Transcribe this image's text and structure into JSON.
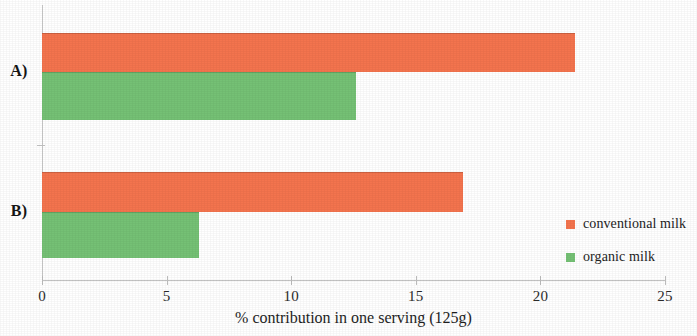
{
  "chart_data": {
    "type": "bar",
    "orientation": "horizontal",
    "title": "",
    "subtitle": "",
    "categories": [
      "A)",
      "B)"
    ],
    "series": [
      {
        "name": "conventional milk",
        "color": "#f4744e",
        "values": [
          21.4,
          16.9
        ]
      },
      {
        "name": "organic milk",
        "color": "#75c175",
        "values": [
          12.6,
          6.3
        ]
      }
    ],
    "xlabel": "% contribution in one serving (125g)",
    "ylabel": "",
    "xlim": [
      0,
      25
    ],
    "xticks": [
      0,
      5,
      10,
      15,
      20,
      25
    ],
    "xtick_labels": [
      "0",
      "5",
      "10",
      "15",
      "20",
      "25"
    ],
    "grid": false,
    "legend_position": "inside-right-lower",
    "annotations": []
  },
  "axis": {
    "x_title": "% contribution in one serving (125g)",
    "ticks": [
      {
        "value": 0,
        "label": "0"
      },
      {
        "value": 5,
        "label": "5"
      },
      {
        "value": 10,
        "label": "10"
      },
      {
        "value": 15,
        "label": "15"
      },
      {
        "value": 20,
        "label": "20"
      },
      {
        "value": 25,
        "label": "25"
      }
    ]
  },
  "groups": [
    {
      "label": "A)",
      "bars": [
        {
          "series": "conventional milk",
          "value": 21.4
        },
        {
          "series": "organic milk",
          "value": 12.6
        }
      ]
    },
    {
      "label": "B)",
      "bars": [
        {
          "series": "conventional milk",
          "value": 16.9
        },
        {
          "series": "organic milk",
          "value": 6.3
        }
      ]
    }
  ],
  "legend": {
    "items": [
      {
        "label": "conventional milk",
        "color": "#f4744e"
      },
      {
        "label": "organic milk",
        "color": "#75c175"
      }
    ]
  },
  "colors": {
    "conventional": "#f4744e",
    "organic": "#75c175",
    "axis": "#c3c3c3",
    "text": "#1a1a1a",
    "background": "#ffffff"
  }
}
